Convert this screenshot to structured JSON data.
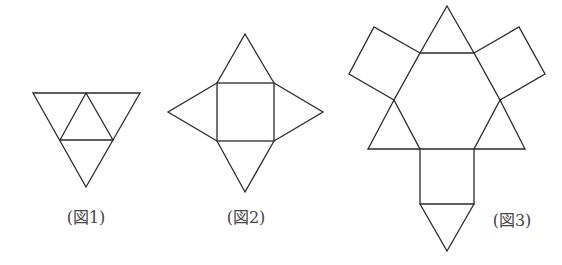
{
  "figures": [
    {
      "id": "fig1",
      "label": "(図1)",
      "description": "Net of a regular tetrahedron: large inverted triangle divided into 4 equilateral triangles",
      "label_pos": [
        86,
        214
      ]
    },
    {
      "id": "fig2",
      "label": "(図2)",
      "description": "Net of a square pyramid: square with 4 triangles attached",
      "label_pos": [
        246,
        214
      ]
    },
    {
      "id": "fig3",
      "label": "(図3)",
      "description": "Net: regular hexagon with 3 triangles, 3 squares, and a bottom triangle",
      "label_pos": [
        512,
        217
      ]
    }
  ],
  "colors": {
    "stroke": "#2a2a2a",
    "text": "#444444",
    "background": "#ffffff"
  }
}
